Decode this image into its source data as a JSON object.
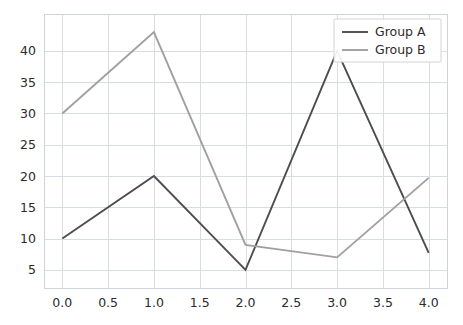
{
  "chart_data": {
    "type": "line",
    "title": "",
    "xlabel": "",
    "ylabel": "",
    "x": [
      0.0,
      1.0,
      2.0,
      3.0,
      4.0
    ],
    "series": [
      {
        "name": "Group A",
        "values": [
          10,
          20,
          5,
          40,
          7.7
        ],
        "color": "#4d4d4d"
      },
      {
        "name": "Group B",
        "values": [
          30,
          43,
          9,
          7,
          19.7
        ],
        "color": "#a0a0a0"
      }
    ],
    "xlim": [
      -0.2,
      4.2
    ],
    "ylim": [
      2.1,
      45.9
    ],
    "xticks": [
      0.0,
      0.5,
      1.0,
      1.5,
      2.0,
      2.5,
      3.0,
      3.5,
      4.0
    ],
    "xtick_labels": [
      "0.0",
      "0.5",
      "1.0",
      "1.5",
      "2.0",
      "2.5",
      "3.0",
      "3.5",
      "4.0"
    ],
    "yticks": [
      5,
      10,
      15,
      20,
      25,
      30,
      35,
      40
    ],
    "ytick_labels": [
      "5",
      "10",
      "15",
      "20",
      "25",
      "30",
      "35",
      "40"
    ],
    "grid": true,
    "grid_color": "#d8dde3",
    "legend": {
      "position": "upper right",
      "entries": [
        "Group A",
        "Group B"
      ]
    },
    "background": "#ffffff"
  }
}
